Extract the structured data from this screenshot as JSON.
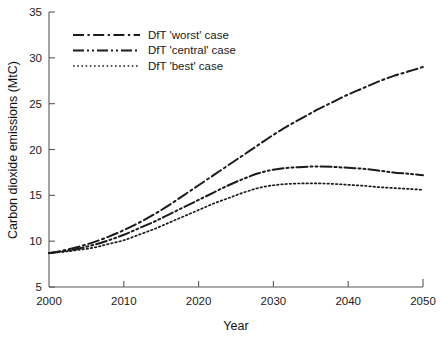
{
  "chart_data": {
    "type": "line",
    "title": "",
    "xlabel": "Year",
    "ylabel": "Carbon dioxide emissions (MtC)",
    "xlim": [
      2000,
      2050
    ],
    "ylim": [
      5,
      35
    ],
    "xticks": [
      "2000",
      "2010",
      "2020",
      "2030",
      "2040",
      "2050"
    ],
    "yticks": [
      "5",
      "10",
      "15",
      "20",
      "25",
      "30",
      "35"
    ],
    "grid": false,
    "legend_position": "top-left",
    "x": [
      2000,
      2002,
      2004,
      2006,
      2008,
      2010,
      2012,
      2014,
      2016,
      2018,
      2020,
      2022,
      2024,
      2026,
      2028,
      2030,
      2032,
      2034,
      2036,
      2038,
      2040,
      2042,
      2044,
      2046,
      2048,
      2050
    ],
    "series": [
      {
        "name": "DfT 'worst' case",
        "dash": "dash-dot",
        "values": [
          8.7,
          9.0,
          9.4,
          9.9,
          10.5,
          11.2,
          12.0,
          12.9,
          13.9,
          15.0,
          16.1,
          17.2,
          18.3,
          19.4,
          20.5,
          21.6,
          22.6,
          23.5,
          24.4,
          25.2,
          26.0,
          26.7,
          27.4,
          28.0,
          28.5,
          29.0
        ]
      },
      {
        "name": "DfT 'central' case",
        "dash": "dash-dot-dot",
        "values": [
          8.7,
          8.9,
          9.2,
          9.6,
          10.1,
          10.7,
          11.4,
          12.1,
          12.9,
          13.7,
          14.5,
          15.3,
          16.1,
          16.8,
          17.4,
          17.8,
          18.0,
          18.1,
          18.15,
          18.1,
          18.0,
          17.9,
          17.7,
          17.5,
          17.35,
          17.2
        ]
      },
      {
        "name": "DfT 'best' case",
        "dash": "dotted",
        "values": [
          8.7,
          8.85,
          9.05,
          9.3,
          9.7,
          10.1,
          10.7,
          11.3,
          12.0,
          12.7,
          13.4,
          14.1,
          14.7,
          15.3,
          15.8,
          16.1,
          16.25,
          16.3,
          16.3,
          16.25,
          16.15,
          16.05,
          15.9,
          15.8,
          15.7,
          15.6
        ]
      }
    ],
    "colors": {
      "line": "#1b1b1b",
      "axis": "#555a5e",
      "background": "#ffffff"
    }
  },
  "legend": {
    "items": [
      {
        "label": "DfT 'worst' case"
      },
      {
        "label": "DfT 'central' case"
      },
      {
        "label": "DfT  'best' case"
      }
    ]
  }
}
